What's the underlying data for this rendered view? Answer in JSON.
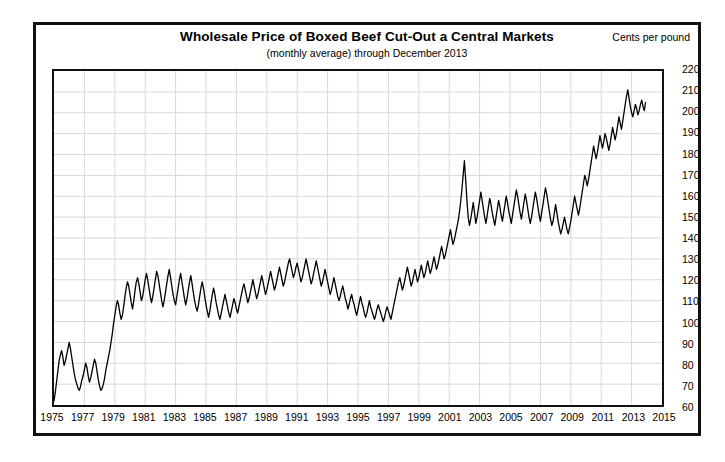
{
  "chart_data": {
    "type": "line",
    "title": "Wholesale Price of Boxed Beef Cut-Out a Central Markets",
    "subtitle": "(monthly average) through December 2013",
    "units_label": "Cents per pound",
    "xlabel": "",
    "ylabel": "Cents per pound",
    "grid": true,
    "legend": "none",
    "xlim": [
      1975,
      2015
    ],
    "ylim": [
      60,
      220
    ],
    "ytick_step": 10,
    "xtick_step": 2,
    "yticks": [
      220,
      210,
      200,
      190,
      180,
      170,
      160,
      150,
      140,
      130,
      120,
      110,
      100,
      90,
      80,
      70,
      60
    ],
    "xticks": [
      1975,
      1977,
      1979,
      1981,
      1983,
      1985,
      1987,
      1989,
      1991,
      1993,
      1995,
      1997,
      1999,
      2001,
      2003,
      2005,
      2007,
      2009,
      2011,
      2013,
      2015
    ],
    "line_color": "#000000",
    "grid_color": "#d8d8d8",
    "series": [
      {
        "name": "Boxed Beef Cut-Out",
        "x_start": 1975.0,
        "x_step": 0.0833333,
        "values": [
          62,
          66,
          71,
          76,
          81,
          84,
          86,
          83,
          79,
          81,
          84,
          87,
          90,
          87,
          83,
          79,
          75,
          72,
          70,
          68,
          67,
          69,
          72,
          74,
          77,
          80,
          78,
          74,
          71,
          73,
          76,
          79,
          82,
          80,
          76,
          72,
          69,
          67,
          68,
          70,
          73,
          77,
          80,
          83,
          86,
          90,
          94,
          99,
          103,
          107,
          110,
          108,
          104,
          101,
          103,
          107,
          112,
          116,
          119,
          117,
          113,
          109,
          106,
          110,
          115,
          119,
          121,
          118,
          114,
          110,
          112,
          116,
          120,
          123,
          120,
          116,
          112,
          109,
          112,
          116,
          120,
          124,
          122,
          118,
          114,
          110,
          107,
          110,
          114,
          118,
          122,
          125,
          121,
          117,
          113,
          110,
          108,
          112,
          116,
          120,
          123,
          119,
          115,
          111,
          108,
          111,
          115,
          119,
          122,
          118,
          114,
          110,
          107,
          105,
          108,
          112,
          116,
          119,
          116,
          112,
          108,
          105,
          102,
          105,
          109,
          113,
          116,
          113,
          109,
          106,
          103,
          101,
          104,
          107,
          110,
          113,
          110,
          107,
          104,
          102,
          105,
          108,
          111,
          109,
          106,
          104,
          107,
          110,
          113,
          116,
          118,
          115,
          112,
          109,
          111,
          114,
          117,
          120,
          117,
          114,
          111,
          113,
          116,
          119,
          122,
          119,
          116,
          113,
          115,
          118,
          121,
          124,
          121,
          118,
          115,
          117,
          120,
          123,
          126,
          123,
          120,
          117,
          119,
          122,
          125,
          128,
          130,
          127,
          124,
          121,
          123,
          126,
          128,
          125,
          122,
          119,
          121,
          124,
          127,
          130,
          127,
          124,
          121,
          118,
          120,
          123,
          126,
          129,
          126,
          123,
          120,
          117,
          119,
          122,
          125,
          122,
          119,
          116,
          113,
          115,
          118,
          121,
          118,
          115,
          112,
          110,
          112,
          115,
          117,
          114,
          111,
          109,
          106,
          108,
          111,
          113,
          110,
          108,
          105,
          103,
          106,
          109,
          112,
          109,
          107,
          104,
          102,
          104,
          107,
          110,
          107,
          105,
          103,
          101,
          103,
          106,
          108,
          106,
          104,
          102,
          100,
          102,
          105,
          107,
          105,
          103,
          101,
          104,
          107,
          110,
          113,
          116,
          119,
          121,
          118,
          115,
          117,
          120,
          123,
          126,
          123,
          120,
          117,
          119,
          122,
          125,
          122,
          119,
          121,
          124,
          127,
          124,
          121,
          123,
          126,
          129,
          126,
          123,
          125,
          128,
          131,
          128,
          125,
          127,
          130,
          133,
          136,
          133,
          130,
          132,
          135,
          138,
          141,
          144,
          140,
          137,
          139,
          142,
          145,
          148,
          152,
          157,
          163,
          170,
          177,
          168,
          158,
          150,
          146,
          149,
          153,
          157,
          152,
          147,
          150,
          154,
          158,
          162,
          158,
          154,
          150,
          147,
          151,
          155,
          159,
          156,
          152,
          149,
          146,
          150,
          154,
          158,
          155,
          151,
          148,
          152,
          156,
          160,
          157,
          153,
          150,
          147,
          151,
          155,
          159,
          163,
          160,
          156,
          152,
          149,
          153,
          157,
          161,
          158,
          154,
          150,
          147,
          150,
          154,
          158,
          162,
          159,
          155,
          151,
          148,
          152,
          156,
          160,
          164,
          161,
          157,
          153,
          149,
          146,
          148,
          152,
          156,
          152,
          148,
          145,
          142,
          144,
          147,
          150,
          147,
          144,
          142,
          145,
          148,
          152,
          156,
          160,
          157,
          154,
          151,
          154,
          158,
          162,
          166,
          170,
          168,
          165,
          168,
          172,
          176,
          180,
          184,
          181,
          178,
          181,
          185,
          189,
          186,
          183,
          186,
          190,
          188,
          185,
          182,
          185,
          189,
          193,
          190,
          187,
          190,
          194,
          198,
          195,
          192,
          196,
          200,
          204,
          208,
          211,
          207,
          203,
          200,
          198,
          201,
          204,
          202,
          199,
          201,
          204,
          206,
          203,
          201,
          205
        ]
      }
    ]
  }
}
